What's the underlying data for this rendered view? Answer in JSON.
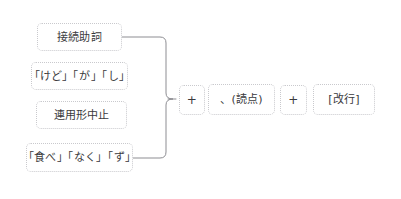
{
  "diagram": {
    "background_color": "#ffffff",
    "box_border_color": "#c9c9cd",
    "text_color": "#3a3a3c",
    "brace_color": "#8d8d92",
    "left_group": {
      "name": "左側の条件ボックス群",
      "items": [
        {
          "label": "接続助詞",
          "x": 37,
          "y": 23,
          "w": 85,
          "h": 28
        },
        {
          "label": "「けど」「が」「し」",
          "x": 31,
          "y": 62,
          "w": 97,
          "h": 28
        },
        {
          "label": "連用形中止",
          "x": 36,
          "y": 101,
          "w": 91,
          "h": 28
        },
        {
          "label": "「食べ」「なく」「ず」",
          "x": 26,
          "y": 143,
          "w": 107,
          "h": 29
        }
      ]
    },
    "brace": {
      "name": "右向き波括弧コネクタ",
      "top_y": 37,
      "bottom_y": 158,
      "left_x_top": 122,
      "left_x_bottom": 133,
      "spine_x": 166,
      "apex_x": 173,
      "apex_y": 99
    },
    "right_group": {
      "name": "右側の連結式",
      "items": [
        {
          "label": "+",
          "kind": "op",
          "x": 179,
          "y": 85,
          "w": 26,
          "h": 30
        },
        {
          "label": "、(読点)",
          "kind": "term",
          "x": 208,
          "y": 84,
          "w": 67,
          "h": 31
        },
        {
          "label": "+",
          "kind": "op",
          "x": 280,
          "y": 85,
          "w": 27,
          "h": 30
        },
        {
          "label": "[改行]",
          "kind": "term",
          "x": 313,
          "y": 84,
          "w": 62,
          "h": 31
        }
      ]
    }
  }
}
